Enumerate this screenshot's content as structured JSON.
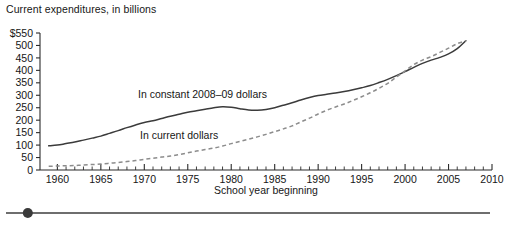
{
  "chart_data": {
    "type": "line",
    "title": "Current expenditures, in billions",
    "xlabel": "School year beginning",
    "ylabel": "",
    "xlim": [
      1958,
      2010
    ],
    "ylim": [
      0,
      550
    ],
    "grid": false,
    "legend_position": "inline-annotation",
    "y_axis": {
      "tick_labels": [
        "$550",
        "500",
        "450",
        "400",
        "350",
        "300",
        "250",
        "200",
        "150",
        "100",
        "50",
        "0"
      ],
      "tick_values": [
        550,
        500,
        450,
        400,
        350,
        300,
        250,
        200,
        150,
        100,
        50,
        0
      ],
      "step": 50,
      "currency_prefix_on_top_tick": "$"
    },
    "x_axis": {
      "major_tick_labels": [
        "1960",
        "1965",
        "1970",
        "1975",
        "1980",
        "1985",
        "1990",
        "1995",
        "2000",
        "2005",
        "2010"
      ],
      "major_tick_values": [
        1960,
        1965,
        1970,
        1975,
        1980,
        1985,
        1990,
        1995,
        2000,
        2005,
        2010
      ],
      "minor_tick_interval": 1
    },
    "x": [
      1959,
      1960,
      1961,
      1962,
      1963,
      1964,
      1965,
      1966,
      1967,
      1968,
      1969,
      1970,
      1971,
      1972,
      1973,
      1974,
      1975,
      1976,
      1977,
      1978,
      1979,
      1980,
      1981,
      1982,
      1983,
      1984,
      1985,
      1986,
      1987,
      1988,
      1989,
      1990,
      1991,
      1992,
      1993,
      1994,
      1995,
      1996,
      1997,
      1998,
      1999,
      2000,
      2001,
      2002,
      2003,
      2004,
      2005,
      2006,
      2007
    ],
    "series": [
      {
        "name": "In constant 2008-09 dollars",
        "label": "In constant 2008–09 dollars",
        "style": "solid",
        "color": "#3b3b3b",
        "values": [
          97,
          100,
          106,
          112,
          120,
          128,
          136,
          147,
          158,
          170,
          181,
          191,
          198,
          207,
          216,
          224,
          232,
          238,
          244,
          250,
          254,
          252,
          246,
          241,
          240,
          243,
          250,
          260,
          270,
          281,
          291,
          299,
          304,
          309,
          315,
          322,
          330,
          339,
          351,
          364,
          379,
          395,
          412,
          428,
          441,
          452,
          466,
          487,
          519
        ]
      },
      {
        "name": "In current dollars",
        "label": "In current dollars",
        "style": "dashed",
        "color": "#8c8c8c",
        "values": [
          15,
          16,
          17,
          18,
          20,
          22,
          24,
          27,
          30,
          34,
          38,
          43,
          47,
          52,
          56,
          62,
          69,
          76,
          82,
          88,
          96,
          106,
          115,
          124,
          133,
          143,
          154,
          165,
          177,
          193,
          208,
          225,
          240,
          253,
          265,
          279,
          294,
          310,
          328,
          348,
          373,
          398,
          423,
          441,
          455,
          472,
          489,
          507,
          519
        ]
      }
    ],
    "annotations": [
      {
        "text": "In constant 2008–09 dollars",
        "x_px": 138,
        "y_px": 95
      },
      {
        "text": "In current dollars",
        "x_px": 140,
        "y_px": 136
      }
    ]
  },
  "slider": {
    "name": "horizontal-scroll-slider",
    "value_fraction": 0.045,
    "track_color": "#6e6e6e",
    "knob_color": "#3a3a3a"
  }
}
